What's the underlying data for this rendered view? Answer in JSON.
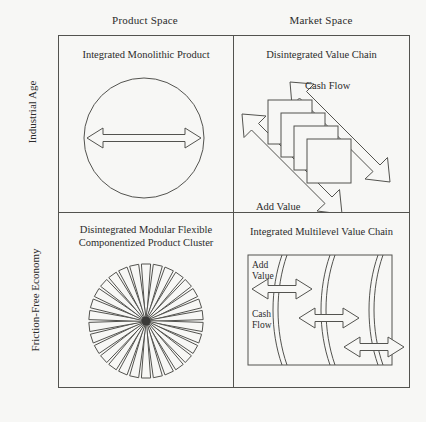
{
  "headers": {
    "columns": [
      {
        "id": "product-space",
        "label": "Product Space"
      },
      {
        "id": "market-space",
        "label": "Market Space"
      }
    ],
    "rows": [
      {
        "id": "industrial-age",
        "label": "Industrial Age"
      },
      {
        "id": "friction-free-economy",
        "label": "Friction-Free Economy"
      }
    ]
  },
  "cells": {
    "top_left": {
      "id": "integrated-monolithic-product",
      "title": "Integrated Monolithic Product",
      "figure": "circle-with-double-arrow"
    },
    "top_right": {
      "id": "disintegrated-value-chain",
      "title": "Disintegrated Value Chain",
      "figure": "cascading-squares-with-diagonal-arrows",
      "labels": {
        "cash_flow": "Cash Flow",
        "add_value": "Add Value"
      },
      "square_count": 4
    },
    "bottom_left": {
      "id": "disintegrated-modular-product-cluster",
      "title_line1": "Disintegrated Modular Flexible",
      "title_line2": "Componentized Product Cluster",
      "figure": "radial-starburst-cluster",
      "spoke_count": 30
    },
    "bottom_right": {
      "id": "integrated-multilevel-value-chain",
      "title": "Integrated Multilevel Value Chain",
      "figure": "curved-bands-with-horizontal-arrows",
      "labels": {
        "add_value_line1": "Add",
        "add_value_line2": "Value",
        "cash_flow_line1": "Cash",
        "cash_flow_line2": "Flow"
      },
      "arrow_count": 3,
      "band_count": 3
    }
  },
  "colors": {
    "background": "#f7f7f5",
    "line": "#53534f",
    "text": "#2b2b2b",
    "center_dot": "#3a3a38"
  }
}
